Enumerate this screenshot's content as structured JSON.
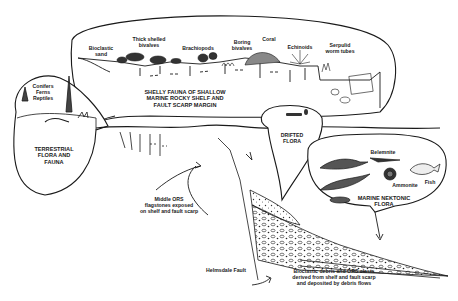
{
  "diagram": {
    "type": "geological cross-section",
    "colors": {
      "ink": "#1a1a1a",
      "paper": "#ffffff",
      "debris_fill": "#d8d8d8"
    },
    "shelf_bubble": {
      "title": "SHELLY FAUNA OF SHALLOW\nMARINE ROCKY SHELF AND\nFAULT SCARP MARGIN",
      "labels": {
        "bioclastic_sand": "Bioclastic\nsand",
        "thick_shelled_bivalves": "Thick shelled\nbivalves",
        "brachiopods": "Brachiopods",
        "boring_bivalves": "Boring\nbivalves",
        "coral": "Coral",
        "echinoids": "Echinoids",
        "serpulid_worm_tubes": "Serpulid\nworm tubes"
      }
    },
    "terrestrial_bubble": {
      "species": "Conifers\nFerns\nReptiles",
      "title": "TERRESTRIAL\nFLORA AND\nFAUNA"
    },
    "drifted_bubble": {
      "title": "DRIFTED\nFLORA"
    },
    "marine_bubble": {
      "title": "MARINE NEKTONIC\nFLORA",
      "labels": {
        "belemnite": "Belemnite",
        "ammonite": "Ammonite",
        "fish": "Fish"
      }
    },
    "annotations": {
      "middle_ors": "Middle ORS\nflagstones exposed\non shelf and fault scarp",
      "helmsdale_fault": "Helmsdale Fault",
      "debris": "Bioclastic debris and ORS clasts\nderived from shelf and fault scarp\nand deposited by debris flows"
    }
  }
}
